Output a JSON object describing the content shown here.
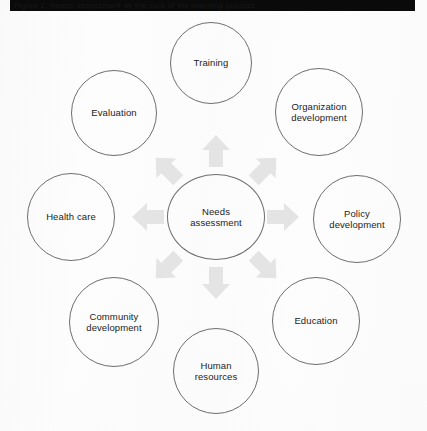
{
  "header": {
    "bar_text": "Figure 1. Needs assessment as the core of the planning process",
    "bar_color": "#0a0a0a"
  },
  "diagram": {
    "type": "radial-hub-and-spoke",
    "background_color": "#fdfdfd",
    "node_stroke_color": "#6e6e6e",
    "arrow_color": "#e4e4e4",
    "center": {
      "id": "needs-assessment",
      "label": "Needs\nassessment",
      "cx": 216,
      "cy": 217,
      "rx": 49,
      "ry": 43
    },
    "spokes": [
      {
        "id": "training",
        "label": "Training",
        "cx": 211,
        "cy": 63,
        "r": 41,
        "direction": "north"
      },
      {
        "id": "organization-development",
        "label": "Organization\ndevelopment",
        "cx": 319,
        "cy": 112,
        "r": 44,
        "direction": "northeast"
      },
      {
        "id": "policy-development",
        "label": "Policy\ndevelopment",
        "cx": 357,
        "cy": 219,
        "r": 44,
        "direction": "east"
      },
      {
        "id": "education",
        "label": "Education",
        "cx": 316,
        "cy": 321,
        "r": 44,
        "direction": "southeast"
      },
      {
        "id": "human-resources",
        "label": "Human\nresources",
        "cx": 216,
        "cy": 371,
        "r": 43,
        "direction": "south"
      },
      {
        "id": "community-development",
        "label": "Community\ndevelopment",
        "cx": 114,
        "cy": 322,
        "r": 45,
        "direction": "southwest"
      },
      {
        "id": "health-care",
        "label": "Health care",
        "cx": 71,
        "cy": 217,
        "r": 44,
        "direction": "west"
      },
      {
        "id": "evaluation",
        "label": "Evaluation",
        "cx": 114,
        "cy": 113,
        "r": 43,
        "direction": "northwest"
      }
    ],
    "arrows": [
      {
        "id": "arrow-north",
        "x": 201,
        "y": 134,
        "rotation": 0,
        "points_to": "training"
      },
      {
        "id": "arrow-northeast",
        "x": 250,
        "y": 152,
        "rotation": 45,
        "points_to": "organization-development"
      },
      {
        "id": "arrow-east",
        "x": 268,
        "y": 200,
        "rotation": 90,
        "points_to": "policy-development"
      },
      {
        "id": "arrow-southeast",
        "x": 250,
        "y": 250,
        "rotation": 135,
        "points_to": "education"
      },
      {
        "id": "arrow-south",
        "x": 201,
        "y": 266,
        "rotation": 180,
        "points_to": "human-resources"
      },
      {
        "id": "arrow-southwest",
        "x": 152,
        "y": 250,
        "rotation": 225,
        "points_to": "community-development"
      },
      {
        "id": "arrow-west",
        "x": 133,
        "y": 200,
        "rotation": 270,
        "points_to": "health-care"
      },
      {
        "id": "arrow-northwest",
        "x": 152,
        "y": 152,
        "rotation": 315,
        "points_to": "evaluation"
      }
    ]
  }
}
